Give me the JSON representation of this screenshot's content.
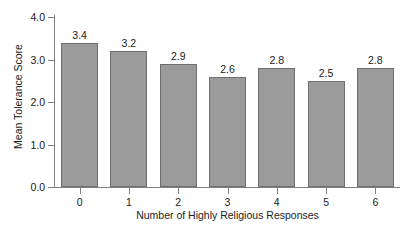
{
  "chart_data": {
    "type": "bar",
    "title": "",
    "xlabel": "Number of Highly Religious Responses",
    "ylabel": "Mean Tolerance Score",
    "categories": [
      "0",
      "1",
      "2",
      "3",
      "4",
      "5",
      "6"
    ],
    "values": [
      3.4,
      3.2,
      2.9,
      2.6,
      2.8,
      2.5,
      2.8
    ],
    "value_labels": [
      "3.4",
      "3.2",
      "2.9",
      "2.6",
      "2.8",
      "2.5",
      "2.8"
    ],
    "ylim": [
      0.0,
      4.0
    ],
    "yticks": [
      0.0,
      1.0,
      2.0,
      3.0,
      4.0
    ],
    "ytick_labels": [
      "0.0",
      "1.0",
      "2.0",
      "3.0",
      "4.0"
    ],
    "grid": false,
    "legend": false,
    "legend_position": "none",
    "bar_fill_color": "#9b9b9b",
    "bar_border_color": "#6f6f6f",
    "axis_color": "#808080",
    "background_color": "#ffffff",
    "text_color": "#1a1a1a"
  }
}
